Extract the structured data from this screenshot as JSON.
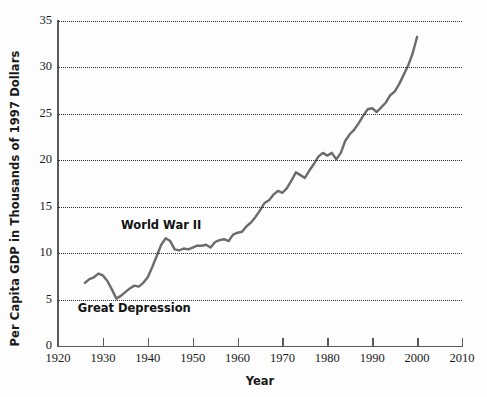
{
  "chart_data": {
    "type": "line",
    "title": "",
    "xlabel": "Year",
    "ylabel": "Per Capita GDP in Thousands of 1997 Dollars",
    "xlim": [
      1920,
      2010
    ],
    "ylim": [
      0,
      35
    ],
    "grid": true,
    "grid_axis": "y",
    "legend": "none",
    "line_color": "#6b6b6b",
    "background_color": "#fdfdfd",
    "axis_color": "#5a5a5a",
    "text_color": "#1a1a1a",
    "x_ticks": [
      1920,
      1930,
      1940,
      1950,
      1960,
      1970,
      1980,
      1990,
      2000,
      2010
    ],
    "x_tick_labels": [
      "1920",
      "1930",
      "1940",
      "1950",
      "1960",
      "1970",
      "1980",
      "1990",
      "2000",
      "2010"
    ],
    "y_ticks": [
      0,
      5,
      10,
      15,
      20,
      25,
      30,
      35
    ],
    "y_tick_labels": [
      "0",
      "5",
      "10",
      "15",
      "20",
      "25",
      "30",
      "35"
    ],
    "annotations": [
      {
        "text": "World War II",
        "x": 1943,
        "y": 12.9
      },
      {
        "text": "Great Depression",
        "x": 1937,
        "y": 4.0
      }
    ],
    "series": [
      {
        "name": "Per Capita GDP",
        "x": [
          1926,
          1927,
          1928,
          1929,
          1930,
          1931,
          1932,
          1933,
          1934,
          1935,
          1936,
          1937,
          1938,
          1939,
          1940,
          1941,
          1942,
          1943,
          1944,
          1945,
          1946,
          1947,
          1948,
          1949,
          1950,
          1951,
          1952,
          1953,
          1954,
          1955,
          1956,
          1957,
          1958,
          1959,
          1960,
          1961,
          1962,
          1963,
          1964,
          1965,
          1966,
          1967,
          1968,
          1969,
          1970,
          1971,
          1972,
          1973,
          1974,
          1975,
          1976,
          1977,
          1978,
          1979,
          1980,
          1981,
          1982,
          1983,
          1984,
          1985,
          1986,
          1987,
          1988,
          1989,
          1990,
          1991,
          1992,
          1993,
          1994,
          1995,
          1996,
          1997,
          1998,
          1999,
          2000
        ],
        "y": [
          6.8,
          7.2,
          7.4,
          7.8,
          7.6,
          7.0,
          6.1,
          5.1,
          5.4,
          5.8,
          6.2,
          6.5,
          6.4,
          6.8,
          7.4,
          8.5,
          9.7,
          10.9,
          11.6,
          11.3,
          10.4,
          10.3,
          10.5,
          10.4,
          10.6,
          10.8,
          10.8,
          10.9,
          10.6,
          11.2,
          11.4,
          11.5,
          11.3,
          12.0,
          12.2,
          12.3,
          12.9,
          13.3,
          13.9,
          14.6,
          15.4,
          15.7,
          16.3,
          16.7,
          16.5,
          17.0,
          17.8,
          18.7,
          18.4,
          18.1,
          18.9,
          19.6,
          20.4,
          20.8,
          20.5,
          20.8,
          20.1,
          20.8,
          22.1,
          22.8,
          23.3,
          24.0,
          24.8,
          25.5,
          25.6,
          25.2,
          25.7,
          26.2,
          27.0,
          27.4,
          28.2,
          29.2,
          30.2,
          31.5,
          33.3
        ]
      }
    ]
  }
}
